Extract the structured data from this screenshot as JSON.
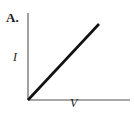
{
  "figure": {
    "panel_label": "A.",
    "background_color": "#ffffff"
  },
  "axes": {
    "y_label": "I",
    "x_label": "V",
    "axis_color": "#8a8a8a",
    "origin_x": 28,
    "origin_y": 100,
    "y_axis_top": 13,
    "x_axis_right": 130
  },
  "line": {
    "color": "#111111",
    "width": 2.6,
    "x1": 28,
    "y1": 100,
    "x2": 99,
    "y2": 24
  },
  "chart_data": {
    "type": "line",
    "title": "A.",
    "xlabel": "V",
    "ylabel": "I",
    "series": [
      {
        "name": "I vs V",
        "x": [
          0,
          1
        ],
        "values": [
          0,
          1
        ]
      }
    ],
    "x": [
      0,
      1
    ],
    "xlim": [
      0,
      1.44
    ],
    "ylim": [
      0,
      1.14
    ],
    "grid": false,
    "legend": false,
    "xticks": [],
    "yticks": [],
    "annotations": [
      "A."
    ]
  }
}
